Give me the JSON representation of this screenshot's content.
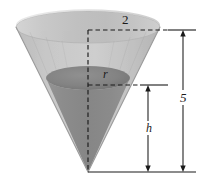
{
  "figure": {
    "kind": "geometry-diagram",
    "background_color": "#ffffff"
  },
  "labels": {
    "top_radius": "2",
    "inner_radius": "r",
    "inner_height": "h",
    "total_height": "5"
  },
  "colors": {
    "cone_rim_light": "#e8e8e8",
    "cone_wall_light": "#c5c5c5",
    "cone_wall_mid": "#b0b0b0",
    "cone_lower_gray": "#8a8a8a",
    "liquid_surface_dark": "#858585",
    "liquid_surface_darker": "#6f6f6f",
    "line_color": "#1a1a1a",
    "outline_color": "#9a9a9a"
  },
  "geometry": {
    "apex": {
      "x": 88,
      "y": 172
    },
    "top_ellipse": {
      "cx": 88,
      "cy": 27,
      "rx": 72,
      "ry": 16
    },
    "inner_ellipse": {
      "cx": 88,
      "cy": 78,
      "rx": 42,
      "ry": 12
    },
    "axis_line": {
      "x": 88,
      "y_top": 30,
      "y_bottom": 172
    },
    "radius_dash_top": {
      "y": 30,
      "x_start": 88,
      "x_end": 168
    },
    "radius_dash_inner": {
      "y": 85,
      "x_start": 88,
      "x_end": 140
    },
    "dimension_total": {
      "x": 183,
      "y_top": 30,
      "y_bottom": 172
    },
    "dimension_inner": {
      "x": 148,
      "y_top": 85,
      "y_bottom": 172
    },
    "tick_top": {
      "y": 30,
      "x_start": 168,
      "x_end": 196
    },
    "tick_mid": {
      "y": 85,
      "x_start": 140,
      "x_end": 168
    },
    "tick_base": {
      "y": 172,
      "x_start": 88,
      "x_end": 196
    }
  }
}
